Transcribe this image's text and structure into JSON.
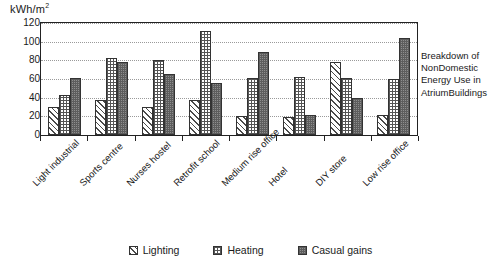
{
  "chart_data": {
    "type": "bar",
    "title": "",
    "xlabel": "",
    "ylabel": "kWh/m2",
    "ylabel_display": "kWh/m",
    "ylabel_exponent": "2",
    "ylim": [
      0,
      120
    ],
    "ytick_step": 20,
    "yticks": [
      0,
      20,
      40,
      60,
      80,
      100,
      120
    ],
    "grid": true,
    "grid_axis": "y",
    "legend_position": "bottom",
    "categories": [
      "Light industrial",
      "Sports centre",
      "Nurses hostel",
      "Retrofit school",
      "Medium rise office",
      "Hotel",
      "DIY store",
      "Low rise office"
    ],
    "series": [
      {
        "name": "Lighting",
        "values": [
          30,
          37,
          30,
          38,
          20,
          19,
          78,
          21
        ]
      },
      {
        "name": "Heating",
        "values": [
          43,
          82,
          80,
          111,
          61,
          62,
          61,
          60
        ]
      },
      {
        "name": "Casual gains",
        "values": [
          61,
          78,
          65,
          56,
          89,
          21,
          40,
          104
        ]
      }
    ]
  },
  "side_caption": {
    "lines": [
      "Breakdown of",
      "NonDomestic",
      "Energy Use in",
      "AtriumBuildings"
    ]
  },
  "legend": {
    "items": [
      {
        "label": "Lighting"
      },
      {
        "label": "Heating"
      },
      {
        "label": "Casual gains"
      }
    ]
  }
}
